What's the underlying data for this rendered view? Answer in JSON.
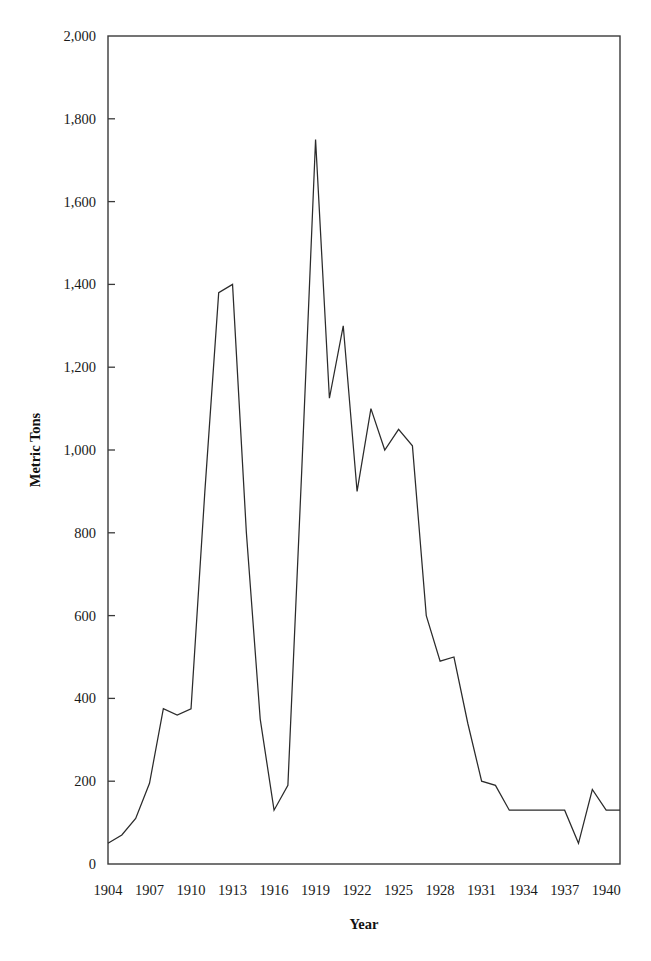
{
  "chart_data": {
    "type": "line",
    "title": "",
    "xlabel": "Year",
    "ylabel": "Metric Tons",
    "xlim": [
      1904,
      1941
    ],
    "ylim": [
      0,
      2000
    ],
    "grid": false,
    "legend": null,
    "ytick_labels": [
      "0",
      "200",
      "400",
      "600",
      "800",
      "1,000",
      "1,200",
      "1,400",
      "1,600",
      "1,800",
      "2,000"
    ],
    "ytick_values": [
      0,
      200,
      400,
      600,
      800,
      1000,
      1200,
      1400,
      1600,
      1800,
      2000
    ],
    "xtick_labels": [
      "1904",
      "1907",
      "1910",
      "1913",
      "1916",
      "1919",
      "1922",
      "1925",
      "1928",
      "1931",
      "1934",
      "1937",
      "1940"
    ],
    "xtick_values": [
      1904,
      1907,
      1910,
      1913,
      1916,
      1919,
      1922,
      1925,
      1928,
      1931,
      1934,
      1937,
      1940
    ],
    "x": [
      1904,
      1905,
      1906,
      1907,
      1908,
      1909,
      1910,
      1911,
      1912,
      1913,
      1914,
      1915,
      1916,
      1917,
      1918,
      1919,
      1920,
      1921,
      1922,
      1923,
      1924,
      1925,
      1926,
      1927,
      1928,
      1929,
      1930,
      1931,
      1932,
      1933,
      1934,
      1935,
      1936,
      1937,
      1938,
      1939,
      1940,
      1941
    ],
    "values": [
      50,
      70,
      110,
      195,
      375,
      360,
      375,
      900,
      1380,
      1400,
      800,
      350,
      130,
      190,
      950,
      1750,
      1125,
      1300,
      900,
      1100,
      1000,
      1050,
      1010,
      600,
      490,
      500,
      340,
      200,
      190,
      130,
      130,
      130,
      130,
      130,
      50,
      180,
      130,
      130
    ],
    "series": [
      {
        "name": "Metric Tons",
        "color": "#2b2b2b",
        "values": [
          50,
          70,
          110,
          195,
          375,
          360,
          375,
          900,
          1380,
          1400,
          800,
          350,
          130,
          190,
          950,
          1750,
          1125,
          1300,
          900,
          1100,
          1000,
          1050,
          1010,
          600,
          490,
          500,
          340,
          200,
          190,
          130,
          130,
          130,
          130,
          130,
          50,
          180,
          130,
          130
        ]
      }
    ],
    "notes": {
      "peak_value": 1750,
      "peak_year": 1919,
      "secondary_peak_value": 1400,
      "secondary_peak_year": 1913,
      "minimum_value": 50
    }
  },
  "figure": {
    "background": "#ffffff",
    "axis_color": "#3a3a3a",
    "line_color": "#2b2b2b"
  }
}
